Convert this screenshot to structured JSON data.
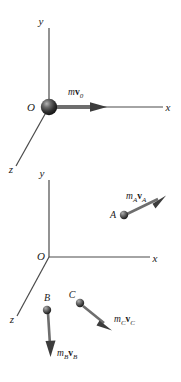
{
  "figure": {
    "background_color": "#ffffff",
    "ink_color": "#1a1a1a",
    "axis_color": "#4a4a4a",
    "arrow_color": "#555555",
    "sphere_color": "#2b2b2b",
    "sphere_highlight": "#9a9a9a"
  },
  "diagrams": [
    {
      "name": "single-particle-diagram",
      "axes": {
        "y_label": "y",
        "x_label": "x",
        "z_label": "z",
        "origin_label": "O"
      },
      "particles": [
        {
          "name": "origin-particle",
          "point_label": "",
          "vector_label_m": "m",
          "vector_label_v": "v",
          "vector_label_sub": "0",
          "vector_label_full": "mv0"
        }
      ]
    },
    {
      "name": "three-particle-diagram",
      "axes": {
        "y_label": "y",
        "x_label": "x",
        "z_label": "z",
        "origin_label": "O"
      },
      "particles": [
        {
          "name": "particle-a",
          "point_label": "A",
          "vector_label_m": "m",
          "vector_label_m_sub": "A",
          "vector_label_v": "v",
          "vector_label_v_sub": "A",
          "vector_label_full": "mAvA"
        },
        {
          "name": "particle-b",
          "point_label": "B",
          "vector_label_m": "m",
          "vector_label_m_sub": "B",
          "vector_label_v": "v",
          "vector_label_v_sub": "B",
          "vector_label_full": "mBvB"
        },
        {
          "name": "particle-c",
          "point_label": "C",
          "vector_label_m": "m",
          "vector_label_m_sub": "C",
          "vector_label_v": "v",
          "vector_label_v_sub": "C",
          "vector_label_full": "mCvC"
        }
      ]
    }
  ]
}
